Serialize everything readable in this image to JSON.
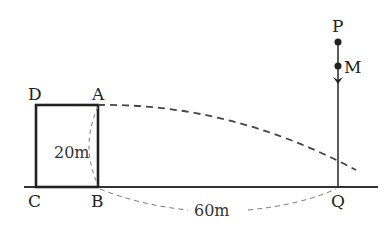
{
  "diagram": {
    "points": {
      "A": "A",
      "B": "B",
      "C": "C",
      "D": "D",
      "P": "P",
      "M": "M",
      "Q": "Q"
    },
    "dimensions": {
      "height_AB": "20m",
      "distance_BQ": "60m"
    },
    "colors": {
      "line": "#333333",
      "dashed": "#555555",
      "background": "#ffffff"
    }
  }
}
